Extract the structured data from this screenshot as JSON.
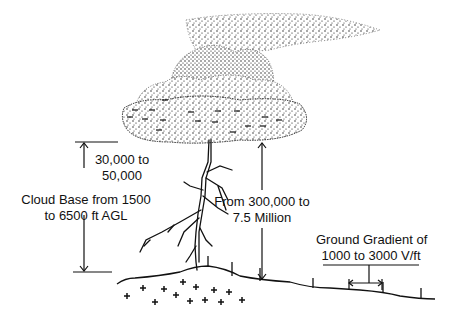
{
  "diagram": {
    "labels": {
      "cloud_base_line1": "Cloud Base from 1500",
      "cloud_base_line2": "to 6500 ft AGL",
      "cloud_charge_line1": "30,000 to",
      "cloud_charge_line2": "50,000",
      "potential_line1": "From 300,000 to",
      "potential_line2": "7.5 Million",
      "gradient_line1": "Ground Gradient of",
      "gradient_line2": "1000 to 3000 V/ft"
    },
    "symbols": {
      "cloud_charge": "−",
      "ground_charge": "+"
    },
    "colors": {
      "ink": "#111111",
      "background": "#ffffff"
    }
  }
}
